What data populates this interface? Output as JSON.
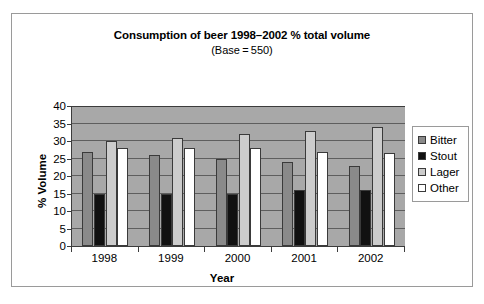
{
  "chart_data": {
    "type": "bar",
    "title": "Consumption of beer 1998–2002 % total volume",
    "subtitle": "(Base = 550)",
    "xlabel": "Year",
    "ylabel": "% Volume",
    "categories": [
      "1998",
      "1999",
      "2000",
      "2001",
      "2002"
    ],
    "ylim": [
      0,
      40
    ],
    "yticks": [
      0,
      5,
      10,
      15,
      20,
      25,
      30,
      35,
      40
    ],
    "grid": true,
    "legend_position": "right",
    "series": [
      {
        "name": "Bitter",
        "color": "#8a8a8a",
        "values": [
          27,
          26,
          25,
          24,
          23
        ]
      },
      {
        "name": "Stout",
        "color": "#111111",
        "values": [
          15,
          15,
          15,
          16,
          16
        ]
      },
      {
        "name": "Lager",
        "color": "#cccccc",
        "values": [
          30,
          31,
          32,
          33,
          34
        ]
      },
      {
        "name": "Other",
        "color": "#ffffff",
        "values": [
          28,
          28,
          28,
          27,
          26.5
        ]
      }
    ],
    "plot_background": "#a8a8a8",
    "gridline_color": "#5e5e5e",
    "axis_color": "#3c3c3c"
  }
}
